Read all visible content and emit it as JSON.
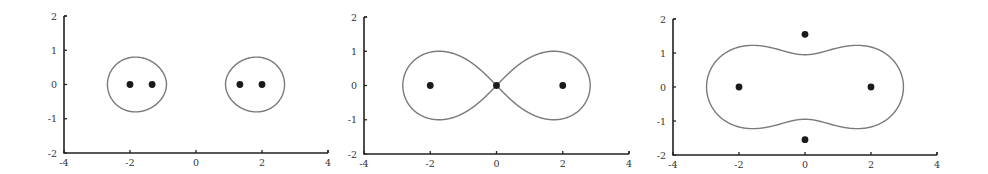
{
  "chart_data": [
    {
      "type": "scatter",
      "title": "",
      "xlabel": "",
      "ylabel": "",
      "xlim": [
        -4,
        4
      ],
      "ylim": [
        -2,
        2
      ],
      "xticks": [
        -4,
        -2,
        0,
        2,
        4
      ],
      "yticks": [
        -2,
        -1,
        0,
        1,
        2
      ],
      "grid": false,
      "legend": null,
      "points": [
        [
          -2,
          0
        ],
        [
          -1.33,
          0
        ],
        [
          1.33,
          0
        ],
        [
          2,
          0
        ]
      ],
      "curve": {
        "description": "level set |z^2 - 4| = c (two ovals)",
        "c": 3.2
      },
      "frame": {
        "x0": 64,
        "x1": 328,
        "y_top": 16,
        "y_bottom": 153
      }
    },
    {
      "type": "scatter",
      "title": "",
      "xlabel": "",
      "ylabel": "",
      "xlim": [
        -4,
        4
      ],
      "ylim": [
        -2,
        2
      ],
      "xticks": [
        -4,
        -2,
        0,
        2,
        4
      ],
      "yticks": [
        -2,
        -1,
        0,
        1,
        2
      ],
      "grid": false,
      "legend": null,
      "points": [
        [
          -2,
          0
        ],
        [
          0,
          0
        ],
        [
          2,
          0
        ]
      ],
      "curve": {
        "description": "level set |z^2 - 4| = c (figure-eight lemniscate)",
        "c": 4.0
      },
      "frame": {
        "x0": 364,
        "x1": 629,
        "y_top": 17,
        "y_bottom": 154
      }
    },
    {
      "type": "scatter",
      "title": "",
      "xlabel": "",
      "ylabel": "",
      "xlim": [
        -4,
        4
      ],
      "ylim": [
        -2,
        2
      ],
      "xticks": [
        -4,
        -2,
        0,
        2,
        4
      ],
      "yticks": [
        -2,
        -1,
        0,
        1,
        2
      ],
      "grid": false,
      "legend": null,
      "points": [
        [
          -2,
          0
        ],
        [
          2,
          0
        ],
        [
          0,
          1.55
        ],
        [
          0,
          -1.55
        ]
      ],
      "curve": {
        "description": "level set |z^2 - 4| = c (single peanut-shaped curve)",
        "c": 4.9
      },
      "frame": {
        "x0": 673,
        "x1": 937,
        "y_top": 19,
        "y_bottom": 155
      }
    }
  ]
}
